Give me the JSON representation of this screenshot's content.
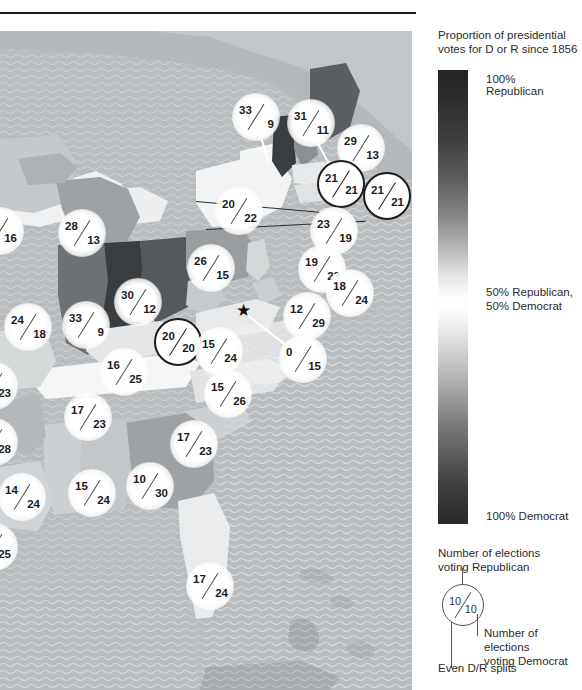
{
  "page": {
    "kind": "choropleth-map-with-markers",
    "ghost_title_fragment": ""
  },
  "legend": {
    "scale_title": "Proportion of presidential votes for D or R since 1856",
    "scale_title_line1": "Proportion of presidential",
    "scale_title_line2": "votes for D or R since 1856",
    "top_label": "100% Republican",
    "mid_label_line1": "50% Republican,",
    "mid_label_line2": "50% Democrat",
    "bottom_label": "100% Democrat",
    "key_title_line1": "Number of elections",
    "key_title_line2": "voting Republican",
    "key_sample_republican": "10",
    "key_sample_democrat": "10",
    "key_dem_label_line1": "Number of elections",
    "key_dem_label_line2": "voting Democrat",
    "key_even_label": "Even D/R splits",
    "colors": {
      "republican_max": "#242424",
      "midpoint": "#ffffff",
      "democrat_max": "#2a2a2a",
      "marker_fill": "#ffffff",
      "even_split_outline": "#1c1c1c",
      "text": "#2b2b2b"
    }
  },
  "map": {
    "capital_star": {
      "name": "capital-star",
      "x": 244,
      "y": 280,
      "glyph": "★"
    },
    "markers": [
      {
        "id": "vt",
        "rep": "33",
        "dem": "9",
        "x": 256,
        "y": 86,
        "style": "halo",
        "even": false
      },
      {
        "id": "me",
        "rep": "31",
        "dem": "11",
        "x": 311,
        "y": 92,
        "style": "halo",
        "even": false
      },
      {
        "id": "nh",
        "rep": "29",
        "dem": "13",
        "x": 361,
        "y": 117,
        "style": "halo",
        "even": false
      },
      {
        "id": "ma",
        "rep": "21",
        "dem": "21",
        "x": 341,
        "y": 153,
        "style": "ring",
        "even": true
      },
      {
        "id": "ri",
        "rep": "21",
        "dem": "21",
        "x": 387,
        "y": 165,
        "style": "ring",
        "even": true
      },
      {
        "id": "ct",
        "rep": "23",
        "dem": "19",
        "x": 334,
        "y": 200,
        "style": "halo",
        "even": false
      },
      {
        "id": "ny",
        "rep": "20",
        "dem": "22",
        "x": 239,
        "y": 180,
        "style": "halo",
        "even": false
      },
      {
        "id": "nj",
        "rep": "19",
        "dem": "23",
        "x": 322,
        "y": 238,
        "style": "halo",
        "even": false
      },
      {
        "id": "de",
        "rep": "18",
        "dem": "24",
        "x": 350,
        "y": 262,
        "style": "halo",
        "even": false
      },
      {
        "id": "pa",
        "rep": "26",
        "dem": "15",
        "x": 211,
        "y": 237,
        "style": "halo",
        "even": false
      },
      {
        "id": "mi",
        "rep": "28",
        "dem": "13",
        "x": 82,
        "y": 202,
        "style": "halo",
        "even": false
      },
      {
        "id": "wi",
        "rep": "",
        "dem": "16",
        "x": 10,
        "y": 200,
        "style": "halo",
        "even": false,
        "clipped": "left"
      },
      {
        "id": "il",
        "rep": "24",
        "dem": "18",
        "x": 28,
        "y": 296,
        "style": "halo",
        "even": false
      },
      {
        "id": "in",
        "rep": "33",
        "dem": "9",
        "x": 86,
        "y": 294,
        "style": "halo",
        "even": false
      },
      {
        "id": "oh",
        "rep": "30",
        "dem": "12",
        "x": 138,
        "y": 271,
        "style": "halo",
        "even": false
      },
      {
        "id": "wv",
        "rep": "20",
        "dem": "20",
        "x": 178,
        "y": 311,
        "style": "ring",
        "even": true
      },
      {
        "id": "md",
        "rep": "15",
        "dem": "24",
        "x": 219,
        "y": 320,
        "style": "halo",
        "even": false
      },
      {
        "id": "va",
        "rep": "12",
        "dem": "29",
        "x": 307,
        "y": 285,
        "style": "halo",
        "even": false
      },
      {
        "id": "dc",
        "rep": "0",
        "dem": "15",
        "x": 303,
        "y": 328,
        "style": "halo",
        "even": false
      },
      {
        "id": "nc",
        "rep": "15",
        "dem": "26",
        "x": 228,
        "y": 363,
        "style": "halo",
        "even": false
      },
      {
        "id": "ky",
        "rep": "16",
        "dem": "25",
        "x": 124,
        "y": 341,
        "style": "halo",
        "even": false
      },
      {
        "id": "tn",
        "rep": "17",
        "dem": "23",
        "x": 88,
        "y": 386,
        "style": "halo",
        "even": false
      },
      {
        "id": "sc",
        "rep": "17",
        "dem": "23",
        "x": 194,
        "y": 413,
        "style": "halo",
        "even": false
      },
      {
        "id": "ga",
        "rep": "10",
        "dem": "30",
        "x": 150,
        "y": 455,
        "style": "halo",
        "even": false
      },
      {
        "id": "al",
        "rep": "15",
        "dem": "24",
        "x": 92,
        "y": 462,
        "style": "halo",
        "even": false
      },
      {
        "id": "ms",
        "rep": "14",
        "dem": "24",
        "x": 22,
        "y": 466,
        "style": "halo",
        "even": false
      },
      {
        "id": "mo",
        "rep": "",
        "dem": "23",
        "x": 4,
        "y": 355,
        "style": "halo",
        "even": false,
        "clipped": "left"
      },
      {
        "id": "ar",
        "rep": "",
        "dem": "28",
        "x": 4,
        "y": 411,
        "style": "halo",
        "even": false,
        "clipped": "left"
      },
      {
        "id": "la",
        "rep": "",
        "dem": "25",
        "x": 4,
        "y": 516,
        "style": "halo",
        "even": false,
        "clipped": "left"
      },
      {
        "id": "fl",
        "rep": "17",
        "dem": "24",
        "x": 210,
        "y": 555,
        "style": "halo",
        "even": false
      }
    ]
  }
}
